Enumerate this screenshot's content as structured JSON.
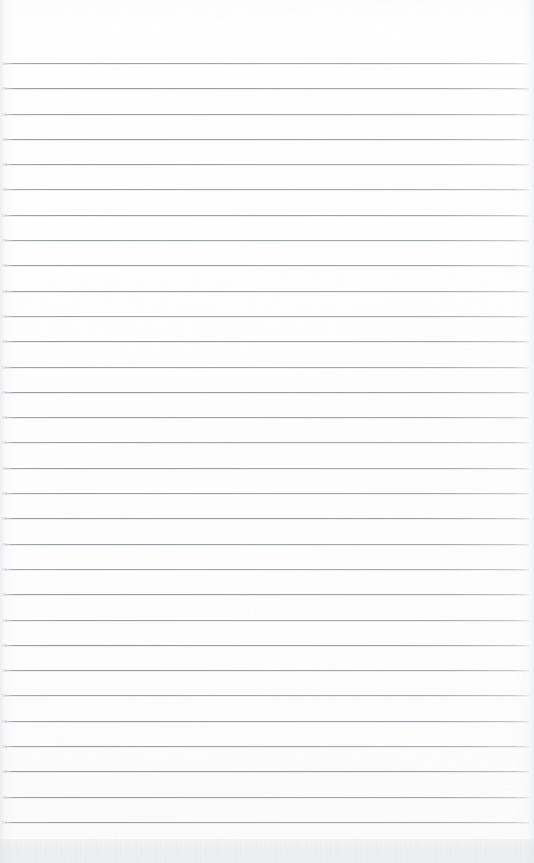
{
  "document": {
    "kind": "scanned-lined-paper",
    "title": "Blank ruled notebook page",
    "description": "A scanned blank sheet of ruled (lined) paper with no written content.",
    "page_width": 534,
    "page_height": 863,
    "background_color": "#fefefe",
    "has_text_content": false,
    "visible_text": ""
  },
  "ruling": {
    "line_color": "#969ba2",
    "line_highlight_color": "#ebecee",
    "line_thickness": 1,
    "line_count": 31,
    "first_line_y": 63,
    "line_spacing": 25.3,
    "line_left": 5,
    "line_right": 529,
    "line_width": 524
  },
  "regions": {
    "top_margin": {
      "label": "top-margin",
      "y": 0,
      "height": 63,
      "color": "#ffffff"
    },
    "ruled_area": {
      "label": "ruled-area",
      "y": 63,
      "height": 776
    },
    "bottom_band": {
      "label": "bottom-band",
      "y": 839,
      "height": 24,
      "color": "#f1f2f3"
    }
  }
}
